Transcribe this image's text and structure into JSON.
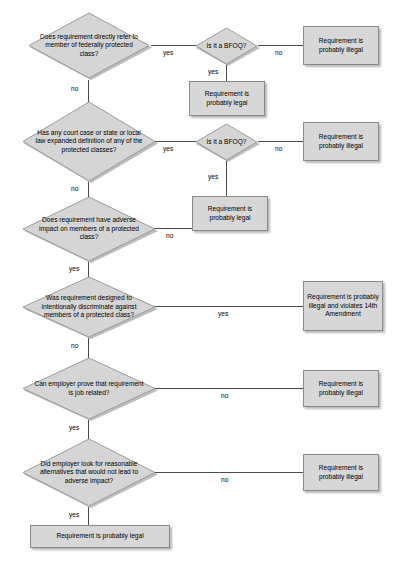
{
  "diagram": {
    "style": {
      "shape_fill": "#d5d5d5",
      "shape_border": "#9a9a9a",
      "line_color": "#4a4a4a",
      "text_color": "#000000",
      "background": "#ffffff"
    },
    "edge_labels": {
      "yes": "yes",
      "no": "no"
    },
    "decisions": [
      {
        "id": "d1",
        "text": "Does requirement directly refer to member of federally protected class?",
        "yes": "yes",
        "no": "no"
      },
      {
        "id": "bfoq1",
        "text": "Is it a BFOQ?",
        "yes": "yes",
        "no": "no"
      },
      {
        "id": "d2",
        "text": "Has any court case or state or local law expanded definition of any of the protected classes?",
        "yes": "yes",
        "no": "no"
      },
      {
        "id": "bfoq2",
        "text": "Is it a BFOQ?",
        "yes": "yes",
        "no": "no"
      },
      {
        "id": "d3",
        "text": "Does requirement have adverse impact on members of a protected class?",
        "yes": "yes",
        "no": "no"
      },
      {
        "id": "d4",
        "text": "Was requirement designed to intentionally discriminate against members of a protected class?",
        "yes": "yes",
        "no": "no"
      },
      {
        "id": "d5",
        "text": "Can employer prove that requirement is job related?",
        "yes": "yes",
        "no": "no"
      },
      {
        "id": "d6",
        "text": "Did employer look for reasonable alternatives that would not lead to adverse impact?",
        "yes": "yes",
        "no": "no"
      }
    ],
    "terminals": [
      {
        "id": "t1",
        "text": "Requirement is probably illegal"
      },
      {
        "id": "t2",
        "text": "Requirement is probably legal"
      },
      {
        "id": "t3",
        "text": "Requirement is probably illegal"
      },
      {
        "id": "t4",
        "text": "Requirement is probably legal"
      },
      {
        "id": "t5",
        "text": "Requirement is probably illegal and violates 14th Amendment"
      },
      {
        "id": "t6",
        "text": "Requirement is probably illegal"
      },
      {
        "id": "t7",
        "text": "Requirement is probably illegal"
      },
      {
        "id": "t8",
        "text": "Requirement is probably legal"
      }
    ]
  }
}
